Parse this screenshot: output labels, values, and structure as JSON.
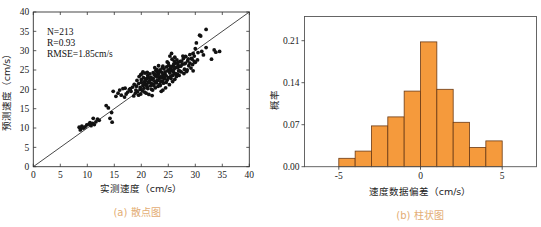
{
  "chart_data": [
    {
      "type": "scatter",
      "title": "",
      "caption": "(a) 散点图",
      "xlabel": "实测速度（cm/s）",
      "ylabel": "预测速度（cm/s）",
      "xlim": [
        0,
        40
      ],
      "ylim": [
        0,
        40
      ],
      "xticks": [
        0,
        5,
        10,
        15,
        20,
        25,
        30,
        35,
        40
      ],
      "yticks": [
        0,
        5,
        10,
        15,
        20,
        25,
        30,
        35,
        40
      ],
      "annotations": [
        "N=213",
        "R=0.93",
        "RMSE=1.85cm/s"
      ],
      "reference_line": {
        "from": [
          0,
          0
        ],
        "to": [
          40,
          40
        ],
        "label": "y=x"
      },
      "grid": false,
      "points": [
        [
          8.5,
          10.2
        ],
        [
          8.8,
          9.8
        ],
        [
          9.0,
          10.5
        ],
        [
          9.3,
          10.0
        ],
        [
          9.6,
          10.3
        ],
        [
          8.7,
          9.5
        ],
        [
          9.9,
          10.8
        ],
        [
          10.3,
          11.0
        ],
        [
          10.7,
          10.6
        ],
        [
          11.0,
          11.2
        ],
        [
          11.3,
          10.9
        ],
        [
          11.6,
          11.6
        ],
        [
          11.9,
          12.3
        ],
        [
          12.2,
          12.0
        ],
        [
          11.1,
          12.5
        ],
        [
          10.5,
          11.4
        ],
        [
          13.5,
          15.8
        ],
        [
          13.9,
          15.2
        ],
        [
          14.2,
          12.5
        ],
        [
          14.5,
          14.0
        ],
        [
          14.6,
          11.5
        ],
        [
          14.8,
          19.5
        ],
        [
          15.3,
          18.2
        ],
        [
          15.7,
          19.0
        ],
        [
          16.0,
          19.8
        ],
        [
          16.3,
          18.5
        ],
        [
          16.6,
          20.2
        ],
        [
          16.9,
          18.0
        ],
        [
          17.2,
          18.8
        ],
        [
          17.5,
          19.3
        ],
        [
          17.8,
          20.0
        ],
        [
          18.1,
          19.5
        ],
        [
          18.4,
          20.6
        ],
        [
          18.6,
          18.3
        ],
        [
          18.9,
          19.0
        ],
        [
          19.1,
          20.8
        ],
        [
          19.3,
          19.4
        ],
        [
          19.5,
          21.5
        ],
        [
          19.6,
          23.3
        ],
        [
          19.8,
          20.0
        ],
        [
          19.9,
          18.8
        ],
        [
          20.0,
          22.5
        ],
        [
          20.1,
          24.0
        ],
        [
          20.2,
          19.6
        ],
        [
          20.3,
          21.0
        ],
        [
          20.4,
          23.0
        ],
        [
          20.5,
          20.3
        ],
        [
          20.6,
          22.0
        ],
        [
          20.7,
          24.2
        ],
        [
          20.8,
          21.4
        ],
        [
          20.9,
          19.0
        ],
        [
          21.0,
          22.8
        ],
        [
          21.1,
          20.6
        ],
        [
          21.2,
          23.6
        ],
        [
          21.3,
          21.8
        ],
        [
          21.4,
          18.7
        ],
        [
          21.5,
          22.2
        ],
        [
          21.6,
          24.0
        ],
        [
          21.7,
          20.9
        ],
        [
          21.8,
          23.1
        ],
        [
          21.9,
          21.5
        ],
        [
          22.0,
          22.6
        ],
        [
          22.1,
          19.8
        ],
        [
          22.2,
          24.3
        ],
        [
          22.3,
          21.2
        ],
        [
          22.4,
          23.8
        ],
        [
          22.5,
          22.0
        ],
        [
          22.6,
          20.4
        ],
        [
          22.7,
          23.4
        ],
        [
          22.8,
          21.7
        ],
        [
          22.9,
          24.6
        ],
        [
          23.0,
          22.3
        ],
        [
          23.1,
          20.8
        ],
        [
          23.2,
          23.9
        ],
        [
          23.3,
          22.7
        ],
        [
          23.4,
          21.3
        ],
        [
          23.5,
          25.0
        ],
        [
          23.6,
          23.2
        ],
        [
          23.7,
          19.5
        ],
        [
          23.8,
          24.4
        ],
        [
          23.9,
          22.1
        ],
        [
          24.0,
          23.7
        ],
        [
          24.1,
          21.6
        ],
        [
          24.2,
          25.3
        ],
        [
          24.3,
          22.9
        ],
        [
          24.4,
          24.0
        ],
        [
          24.5,
          20.4
        ],
        [
          24.6,
          23.5
        ],
        [
          24.7,
          25.8
        ],
        [
          24.8,
          22.4
        ],
        [
          24.9,
          24.8
        ],
        [
          25.0,
          23.0
        ],
        [
          25.1,
          26.2
        ],
        [
          25.2,
          21.2
        ],
        [
          25.3,
          24.2
        ],
        [
          25.4,
          25.5
        ],
        [
          25.5,
          22.8
        ],
        [
          25.6,
          24.9
        ],
        [
          25.7,
          27.8
        ],
        [
          25.8,
          23.6
        ],
        [
          25.9,
          26.0
        ],
        [
          26.0,
          24.4
        ],
        [
          26.1,
          25.3
        ],
        [
          26.2,
          22.6
        ],
        [
          26.3,
          26.8
        ],
        [
          26.4,
          24.0
        ],
        [
          26.5,
          25.7
        ],
        [
          26.6,
          27.6
        ],
        [
          26.7,
          23.9
        ],
        [
          26.8,
          26.3
        ],
        [
          26.9,
          24.8
        ],
        [
          27.0,
          25.9
        ],
        [
          27.2,
          27.2
        ],
        [
          27.4,
          24.5
        ],
        [
          27.6,
          26.5
        ],
        [
          27.8,
          28.0
        ],
        [
          28.0,
          25.2
        ],
        [
          28.2,
          26.8
        ],
        [
          28.4,
          24.6
        ],
        [
          28.6,
          27.4
        ],
        [
          28.8,
          26.1
        ],
        [
          29.0,
          29.0
        ],
        [
          29.2,
          25.5
        ],
        [
          29.4,
          27.8
        ],
        [
          29.5,
          26.4
        ],
        [
          29.6,
          24.8
        ],
        [
          29.8,
          28.6
        ],
        [
          30.0,
          30.5
        ],
        [
          30.0,
          27.0
        ],
        [
          30.2,
          32.0
        ],
        [
          30.5,
          29.5
        ],
        [
          30.8,
          34.0
        ],
        [
          31.0,
          33.8
        ],
        [
          31.2,
          29.8
        ],
        [
          32.0,
          35.5
        ],
        [
          32.0,
          30.8
        ],
        [
          33.0,
          27.8
        ],
        [
          33.5,
          30.2
        ],
        [
          33.8,
          29.6
        ],
        [
          34.5,
          29.8
        ],
        [
          19.2,
          22.3
        ],
        [
          20.3,
          24.5
        ],
        [
          21.7,
          22.9
        ],
        [
          22.5,
          25.6
        ],
        [
          23.2,
          26.1
        ],
        [
          24.8,
          27.1
        ],
        [
          25.3,
          28.6
        ],
        [
          25.6,
          29.3
        ],
        [
          26.2,
          28.3
        ],
        [
          22.0,
          18.4
        ],
        [
          24.0,
          19.8
        ],
        [
          25.8,
          22.0
        ],
        [
          27.0,
          23.6
        ],
        [
          28.5,
          25.0
        ],
        [
          18.0,
          20.2
        ],
        [
          17.0,
          20.3
        ],
        [
          19.5,
          18.5
        ],
        [
          20.6,
          19.3
        ],
        [
          21.9,
          20.0
        ],
        [
          23.5,
          21.0
        ],
        [
          24.6,
          21.8
        ],
        [
          26.5,
          23.3
        ],
        [
          27.9,
          24.1
        ],
        [
          29.0,
          26.8
        ],
        [
          29.8,
          27.2
        ],
        [
          22.7,
          24.9
        ],
        [
          23.9,
          25.6
        ],
        [
          21.0,
          21.0
        ],
        [
          21.5,
          21.9
        ],
        [
          22.2,
          22.8
        ],
        [
          23.0,
          23.3
        ],
        [
          23.8,
          23.0
        ],
        [
          24.4,
          24.5
        ],
        [
          25.0,
          25.0
        ],
        [
          25.5,
          25.9
        ],
        [
          26.0,
          26.5
        ],
        [
          26.8,
          27.0
        ],
        [
          27.5,
          27.3
        ],
        [
          28.2,
          28.5
        ],
        [
          20.0,
          21.8
        ],
        [
          20.8,
          22.3
        ],
        [
          21.3,
          23.0
        ],
        [
          22.6,
          23.9
        ],
        [
          23.3,
          24.6
        ],
        [
          24.2,
          23.4
        ],
        [
          25.2,
          24.6
        ],
        [
          25.9,
          25.0
        ],
        [
          26.7,
          25.6
        ],
        [
          27.3,
          26.0
        ],
        [
          28.0,
          26.6
        ],
        [
          29.3,
          28.0
        ],
        [
          19.0,
          19.8
        ],
        [
          19.8,
          20.5
        ],
        [
          20.5,
          21.3
        ],
        [
          21.2,
          20.2
        ],
        [
          22.3,
          21.0
        ],
        [
          23.6,
          22.0
        ],
        [
          24.3,
          22.7
        ],
        [
          25.4,
          23.3
        ],
        [
          26.3,
          24.0
        ],
        [
          27.1,
          24.8
        ],
        [
          28.7,
          27.9
        ],
        [
          29.6,
          29.3
        ],
        [
          30.4,
          27.6
        ],
        [
          31.5,
          28.9
        ],
        [
          18.7,
          21.3
        ],
        [
          19.9,
          23.8
        ],
        [
          21.1,
          24.4
        ],
        [
          22.9,
          25.1
        ],
        [
          24.0,
          26.0
        ],
        [
          25.0,
          26.8
        ],
        [
          26.1,
          27.3
        ],
        [
          27.7,
          28.6
        ]
      ]
    },
    {
      "type": "bar",
      "subtype": "histogram",
      "title": "",
      "caption": "(b) 柱状图",
      "xlabel": "速度数据偏差（cm/s）",
      "ylabel": "概率",
      "xlim": [
        -7.1,
        7.1
      ],
      "ylim": [
        0,
        0.25
      ],
      "xticks": [
        -5,
        0,
        5
      ],
      "yticks": [
        0.0,
        0.07,
        0.14,
        0.21
      ],
      "ytick_labels": [
        "0.00",
        "0.07",
        "0.14",
        "0.21"
      ],
      "bin_width": 1,
      "categories": [
        "-5~-4",
        "-4~-3",
        "-3~-2",
        "-2~-1",
        "-1~0",
        "0~1",
        "1~2",
        "2~3",
        "3~4",
        "4~5"
      ],
      "bin_edges": [
        -5,
        -4,
        -3,
        -2,
        -1,
        0,
        1,
        2,
        3,
        4,
        5
      ],
      "values": [
        0.014,
        0.026,
        0.068,
        0.083,
        0.126,
        0.208,
        0.129,
        0.074,
        0.032,
        0.043
      ],
      "grid": false
    }
  ],
  "colors": {
    "bar_fill": "#f59a3c",
    "bar_edge": "#6b3a14",
    "points": "#111111",
    "caption": "#e3ad74",
    "axis": "#333333"
  }
}
